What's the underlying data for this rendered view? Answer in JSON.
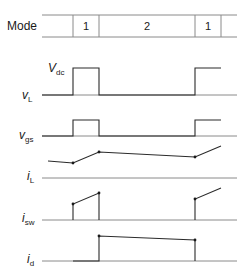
{
  "mode_row": {
    "label": "Mode",
    "cells": [
      {
        "label": "",
        "x0": 42,
        "x1": 73
      },
      {
        "label": "1",
        "x0": 73,
        "x1": 99
      },
      {
        "label": "2",
        "x0": 99,
        "x1": 195
      },
      {
        "label": "1",
        "x0": 195,
        "x1": 221
      },
      {
        "label": "",
        "x0": 221,
        "x1": 237
      }
    ]
  },
  "signals": [
    {
      "id": "vL",
      "label_main": "v",
      "label_sub": "L",
      "annotation": {
        "main": "V",
        "sub": "dc"
      }
    },
    {
      "id": "vgs",
      "label_main": "v",
      "label_sub": "gs"
    },
    {
      "id": "iL",
      "label_main": "i",
      "label_sub": "L"
    },
    {
      "id": "isw",
      "label_main": "i",
      "label_sub": "sw"
    },
    {
      "id": "id",
      "label_main": "i",
      "label_sub": "d"
    }
  ],
  "colors": {
    "line": "#2a2a2a",
    "axis": "#8a8a8a",
    "text": "#1a1a1a"
  }
}
